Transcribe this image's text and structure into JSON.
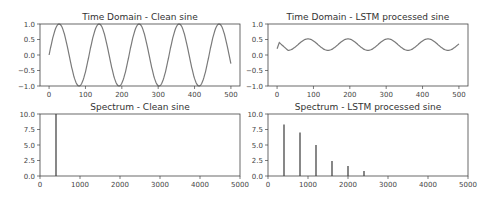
{
  "chart_data": [
    {
      "type": "line",
      "title": "Time Domain - Clean sine",
      "xlabel": "",
      "ylabel": "",
      "xlim": [
        -25,
        525
      ],
      "ylim": [
        -1.0,
        1.0
      ],
      "xticks": [
        "0",
        "100",
        "200",
        "300",
        "400",
        "500"
      ],
      "yticks": [
        "1.0",
        "0.5",
        "0.0",
        "−0.5",
        "−1.0"
      ],
      "series": [
        {
          "name": "clean sine",
          "function": "sin(2*pi*n/110)",
          "n_range": [
            0,
            500
          ],
          "amplitude": 1.0,
          "period_samples": 110
        }
      ],
      "grid": false,
      "color": "#7a7a7a"
    },
    {
      "type": "line",
      "title": "Time Domain - LSTM processed sine",
      "xlabel": "",
      "ylabel": "",
      "xlim": [
        -25,
        525
      ],
      "ylim": [
        -1.0,
        1.0
      ],
      "xticks": [
        "0",
        "100",
        "200",
        "300",
        "400",
        "500"
      ],
      "yticks": [
        "1.0",
        "0.5",
        "0.0",
        "−0.5",
        "−1.0"
      ],
      "series": [
        {
          "name": "LSTM processed sine",
          "n_range": [
            0,
            500
          ],
          "min": 0.15,
          "max": 0.52,
          "period_samples": 110,
          "start_value": 0.2,
          "initial_peak": 0.4
        }
      ],
      "grid": false,
      "color": "#7a7a7a"
    },
    {
      "type": "bar",
      "title": "Spectrum - Clean sine",
      "xlabel": "",
      "ylabel": "",
      "xlim": [
        0,
        5000
      ],
      "ylim": [
        0,
        10.0
      ],
      "xticks": [
        "0",
        "1000",
        "2000",
        "3000",
        "4000",
        "5000"
      ],
      "yticks": [
        "10.0",
        "7.5",
        "5.0",
        "2.5",
        "0.0"
      ],
      "x": [
        400
      ],
      "values": [
        10.0
      ],
      "grid": false,
      "color": "#555555"
    },
    {
      "type": "bar",
      "title": "Spectrum - LSTM processed sine",
      "xlabel": "",
      "ylabel": "",
      "xlim": [
        0,
        5000
      ],
      "ylim": [
        0,
        10.0
      ],
      "xticks": [
        "0",
        "1000",
        "2000",
        "3000",
        "4000",
        "5000"
      ],
      "yticks": [
        "10.0",
        "7.5",
        "5.0",
        "2.5",
        "0.0"
      ],
      "x": [
        400,
        800,
        1200,
        1600,
        2000,
        2400
      ],
      "values": [
        8.3,
        7.0,
        5.0,
        2.4,
        1.6,
        0.8
      ],
      "grid": false,
      "color": "#555555"
    }
  ]
}
